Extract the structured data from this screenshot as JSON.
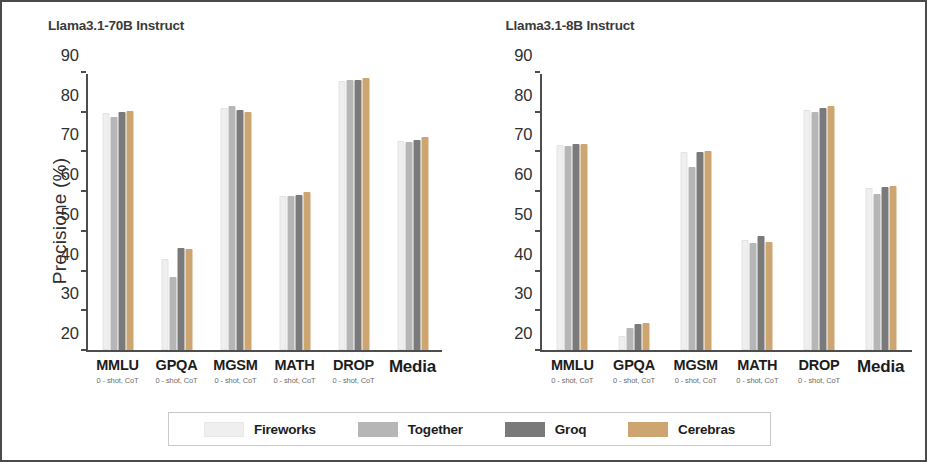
{
  "chart_data": [
    {
      "type": "bar",
      "title": "Llama3.1-70B Instruct",
      "xlabel": "",
      "ylabel": "Precisione (%)",
      "ylim": [
        20,
        90
      ],
      "yticks": [
        20,
        30,
        40,
        50,
        60,
        70,
        80,
        90
      ],
      "grid": false,
      "legend_position": "bottom",
      "categories": [
        "MMLU",
        "GPQA",
        "MGSM",
        "MATH",
        "DROP",
        "Media"
      ],
      "category_subtitles": [
        "0 - shot, CoT",
        "0 - shot, CoT",
        "0 - shot, CoT",
        "0 - shot, CoT",
        "0 - shot, CoT",
        ""
      ],
      "series": [
        {
          "name": "Fireworks",
          "color": "#efefef",
          "values": [
            80.0,
            43.0,
            81.5,
            59.0,
            88.3,
            73.0
          ]
        },
        {
          "name": "Together",
          "color": "#b6b6b6",
          "values": [
            79.2,
            38.5,
            82.0,
            59.0,
            88.5,
            72.8
          ]
        },
        {
          "name": "Groq",
          "color": "#7a7a7a",
          "values": [
            80.3,
            46.0,
            80.8,
            59.2,
            88.6,
            73.3
          ]
        },
        {
          "name": "Cerebras",
          "color": "#cda571",
          "values": [
            80.5,
            45.5,
            80.3,
            60.0,
            89.0,
            74.0
          ]
        }
      ]
    },
    {
      "type": "bar",
      "title": "Llama3.1-8B Instruct",
      "xlabel": "",
      "ylabel": "Precisione (%)",
      "ylim": [
        20,
        90
      ],
      "yticks": [
        20,
        30,
        40,
        50,
        60,
        70,
        80,
        90
      ],
      "grid": false,
      "legend_position": "bottom",
      "categories": [
        "MMLU",
        "GPQA",
        "MGSM",
        "MATH",
        "DROP",
        "Media"
      ],
      "category_subtitles": [
        "0 - shot, CoT",
        "0 - shot, CoT",
        "0 - shot, CoT",
        "0 - shot, CoT",
        "0 - shot, CoT",
        ""
      ],
      "series": [
        {
          "name": "Fireworks",
          "color": "#efefef",
          "values": [
            72.0,
            23.5,
            70.2,
            48.0,
            81.0,
            61.0
          ]
        },
        {
          "name": "Together",
          "color": "#b6b6b6",
          "values": [
            71.8,
            25.5,
            66.3,
            47.2,
            80.3,
            59.5
          ]
        },
        {
          "name": "Groq",
          "color": "#7a7a7a",
          "values": [
            72.2,
            26.5,
            70.3,
            49.0,
            81.3,
            61.3
          ]
        },
        {
          "name": "Cerebras",
          "color": "#cda571",
          "values": [
            72.3,
            26.8,
            70.5,
            47.3,
            82.0,
            61.5
          ]
        }
      ]
    }
  ],
  "legend": {
    "items": [
      {
        "label": "Fireworks",
        "color": "#efefef"
      },
      {
        "label": "Together",
        "color": "#b6b6b6"
      },
      {
        "label": "Groq",
        "color": "#7a7a7a"
      },
      {
        "label": "Cerebras",
        "color": "#cda571"
      }
    ]
  }
}
